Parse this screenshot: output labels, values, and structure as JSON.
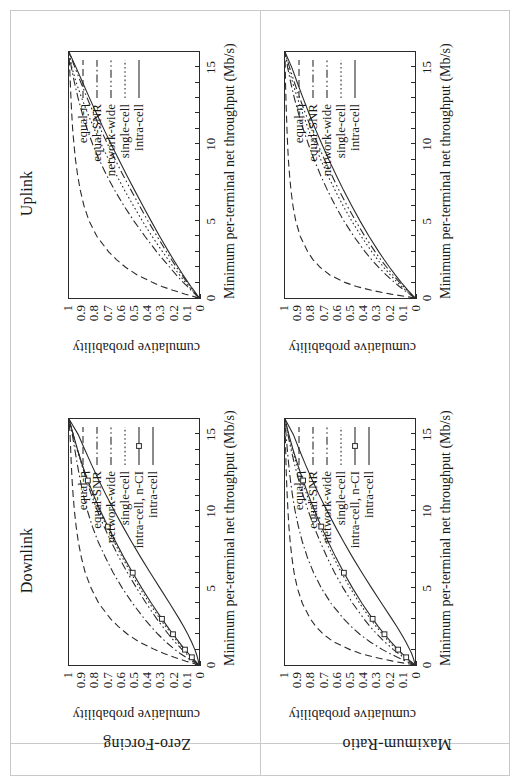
{
  "figure": {
    "orientation": "rotated-90-ccw",
    "columns": [
      "Downlink",
      "Uplink"
    ],
    "rows": [
      "Zero-Forcing",
      "Maximum-Ratio"
    ],
    "axis": {
      "xlabel": "Minimum per-terminal net throughput (Mb/s)",
      "ylabel": "cumulative probability",
      "xticks": [
        "0",
        "5",
        "10",
        "15"
      ],
      "yticks": [
        "0",
        "0.1",
        "0.2",
        "0.3",
        "0.4",
        "0.5",
        "0.6",
        "0.7",
        "0.8",
        "0.9",
        "1"
      ]
    }
  },
  "legend": {
    "downlink": [
      {
        "label": "equal-η",
        "style": "dashed"
      },
      {
        "label": "equal-SNR",
        "style": "dashdot"
      },
      {
        "label": "network-wide",
        "style": "dashdotdot"
      },
      {
        "label": "single-cell",
        "style": "dotted"
      },
      {
        "label": "intra-cell, n-CI",
        "style": "solid-square"
      },
      {
        "label": "intra-cell",
        "style": "solid"
      }
    ],
    "uplink": [
      {
        "label": "equal-η",
        "style": "dashed"
      },
      {
        "label": "equal-SNR",
        "style": "dashdot"
      },
      {
        "label": "network-wide",
        "style": "dashdotdot"
      },
      {
        "label": "single-cell",
        "style": "dotted"
      },
      {
        "label": "intra-cell",
        "style": "solid"
      }
    ]
  },
  "colors": {
    "ink": "#2b2b2b",
    "frame": "#c9c9c9",
    "background": "#ffffff"
  },
  "chart_data": [
    {
      "id": "downlink-zero-forcing",
      "type": "line",
      "title": "Downlink / Zero-Forcing",
      "xlabel": "Minimum per-terminal net throughput (Mb/s)",
      "ylabel": "cumulative probability",
      "xlim": [
        0,
        16
      ],
      "ylim": [
        0,
        1
      ],
      "grid": false,
      "legend_position": "upper-right",
      "x": [
        0,
        0.25,
        0.5,
        0.75,
        1,
        1.5,
        2,
        2.5,
        3,
        4,
        5,
        6,
        7,
        8,
        9,
        10,
        11,
        12,
        13,
        14,
        15,
        16
      ],
      "series": [
        {
          "name": "equal-η",
          "style": "dashed",
          "values": [
            0,
            0.1,
            0.19,
            0.27,
            0.34,
            0.46,
            0.55,
            0.62,
            0.68,
            0.77,
            0.83,
            0.875,
            0.905,
            0.928,
            0.945,
            0.958,
            0.968,
            0.976,
            0.982,
            0.987,
            0.992,
            1.0
          ]
        },
        {
          "name": "equal-SNR",
          "style": "dashdot",
          "values": [
            0,
            0.05,
            0.1,
            0.145,
            0.185,
            0.255,
            0.315,
            0.37,
            0.42,
            0.51,
            0.59,
            0.66,
            0.72,
            0.775,
            0.82,
            0.857,
            0.888,
            0.913,
            0.935,
            0.955,
            0.975,
            1.0
          ]
        },
        {
          "name": "network-wide",
          "style": "dashdotdot",
          "values": [
            0,
            0.035,
            0.07,
            0.1,
            0.13,
            0.185,
            0.235,
            0.28,
            0.325,
            0.405,
            0.48,
            0.55,
            0.615,
            0.675,
            0.73,
            0.78,
            0.825,
            0.865,
            0.9,
            0.935,
            0.968,
            1.0
          ]
        },
        {
          "name": "single-cell",
          "style": "dotted",
          "values": [
            0,
            0.03,
            0.06,
            0.088,
            0.115,
            0.165,
            0.21,
            0.255,
            0.3,
            0.38,
            0.455,
            0.525,
            0.59,
            0.652,
            0.71,
            0.765,
            0.815,
            0.86,
            0.9,
            0.938,
            0.97,
            1.0
          ]
        },
        {
          "name": "intra-cell, n-CI",
          "style": "solid-square",
          "values": [
            0,
            0.028,
            0.055,
            0.082,
            0.108,
            0.155,
            0.2,
            0.243,
            0.285,
            0.365,
            0.44,
            0.51,
            0.578,
            0.64,
            0.7,
            0.757,
            0.808,
            0.855,
            0.897,
            0.934,
            0.968,
            1.0
          ]
        },
        {
          "name": "intra-cell",
          "style": "solid",
          "values": [
            0,
            0.005,
            0.012,
            0.021,
            0.032,
            0.057,
            0.086,
            0.118,
            0.152,
            0.225,
            0.3,
            0.375,
            0.448,
            0.518,
            0.585,
            0.65,
            0.712,
            0.77,
            0.825,
            0.878,
            0.93,
            1.0
          ]
        }
      ]
    },
    {
      "id": "uplink-zero-forcing",
      "type": "line",
      "title": "Uplink / Zero-Forcing",
      "xlabel": "Minimum per-terminal net throughput (Mb/s)",
      "ylabel": "cumulative probability",
      "xlim": [
        0,
        16
      ],
      "ylim": [
        0,
        1
      ],
      "grid": false,
      "legend_position": "upper-right",
      "x": [
        0,
        0.25,
        0.5,
        0.75,
        1,
        1.5,
        2,
        2.5,
        3,
        4,
        5,
        6,
        7,
        8,
        9,
        10,
        11,
        12,
        13,
        14,
        15,
        16
      ],
      "series": [
        {
          "name": "equal-η",
          "style": "dashed",
          "values": [
            0,
            0.105,
            0.2,
            0.285,
            0.355,
            0.475,
            0.565,
            0.635,
            0.695,
            0.785,
            0.845,
            0.885,
            0.913,
            0.934,
            0.95,
            0.962,
            0.972,
            0.979,
            0.985,
            0.99,
            0.995,
            1.0
          ]
        },
        {
          "name": "equal-SNR",
          "style": "dashdot",
          "values": [
            0,
            0.03,
            0.06,
            0.09,
            0.12,
            0.175,
            0.225,
            0.275,
            0.325,
            0.415,
            0.5,
            0.578,
            0.648,
            0.712,
            0.768,
            0.818,
            0.861,
            0.898,
            0.93,
            0.958,
            0.982,
            1.0
          ]
        },
        {
          "name": "network-wide",
          "style": "dashdotdot",
          "values": [
            0,
            0.022,
            0.045,
            0.068,
            0.09,
            0.132,
            0.173,
            0.212,
            0.25,
            0.322,
            0.392,
            0.458,
            0.522,
            0.585,
            0.645,
            0.703,
            0.758,
            0.81,
            0.86,
            0.908,
            0.955,
            1.0
          ]
        },
        {
          "name": "single-cell",
          "style": "dotted",
          "values": [
            0,
            0.026,
            0.052,
            0.078,
            0.103,
            0.15,
            0.195,
            0.238,
            0.28,
            0.36,
            0.435,
            0.505,
            0.572,
            0.635,
            0.695,
            0.752,
            0.806,
            0.856,
            0.902,
            0.944,
            0.978,
            1.0
          ]
        },
        {
          "name": "intra-cell",
          "style": "solid",
          "values": [
            0,
            0.02,
            0.04,
            0.062,
            0.083,
            0.122,
            0.16,
            0.197,
            0.233,
            0.302,
            0.368,
            0.432,
            0.495,
            0.557,
            0.617,
            0.676,
            0.733,
            0.788,
            0.842,
            0.894,
            0.946,
            1.0
          ]
        }
      ]
    },
    {
      "id": "downlink-maximum-ratio",
      "type": "line",
      "title": "Downlink / Maximum-Ratio",
      "xlabel": "Minimum per-terminal net throughput (Mb/s)",
      "ylabel": "cumulative probability",
      "xlim": [
        0,
        16
      ],
      "ylim": [
        0,
        1
      ],
      "grid": false,
      "legend_position": "upper-right",
      "x": [
        0,
        0.25,
        0.5,
        0.75,
        1,
        1.5,
        2,
        2.5,
        3,
        4,
        5,
        6,
        7,
        8,
        9,
        10,
        11,
        12,
        13,
        14,
        15,
        16
      ],
      "series": [
        {
          "name": "equal-η",
          "style": "dashed",
          "values": [
            0,
            0.17,
            0.31,
            0.42,
            0.5,
            0.625,
            0.705,
            0.762,
            0.805,
            0.866,
            0.905,
            0.93,
            0.947,
            0.96,
            0.97,
            0.977,
            0.983,
            0.988,
            0.992,
            0.995,
            0.998,
            1.0
          ]
        },
        {
          "name": "equal-SNR",
          "style": "dashdot",
          "values": [
            0,
            0.07,
            0.135,
            0.195,
            0.25,
            0.345,
            0.425,
            0.49,
            0.548,
            0.645,
            0.72,
            0.78,
            0.828,
            0.866,
            0.897,
            0.922,
            0.942,
            0.958,
            0.971,
            0.982,
            0.992,
            1.0
          ]
        },
        {
          "name": "network-wide",
          "style": "dashdotdot",
          "values": [
            0,
            0.045,
            0.088,
            0.128,
            0.166,
            0.233,
            0.292,
            0.345,
            0.393,
            0.478,
            0.552,
            0.618,
            0.676,
            0.729,
            0.777,
            0.82,
            0.859,
            0.894,
            0.925,
            0.953,
            0.978,
            1.0
          ]
        },
        {
          "name": "single-cell",
          "style": "dotted",
          "values": [
            0,
            0.038,
            0.074,
            0.108,
            0.14,
            0.198,
            0.25,
            0.298,
            0.343,
            0.425,
            0.498,
            0.565,
            0.626,
            0.683,
            0.735,
            0.784,
            0.829,
            0.87,
            0.908,
            0.943,
            0.974,
            1.0
          ]
        },
        {
          "name": "intra-cell, n-CI",
          "style": "solid-square",
          "values": [
            0,
            0.035,
            0.068,
            0.1,
            0.13,
            0.185,
            0.235,
            0.282,
            0.326,
            0.407,
            0.48,
            0.547,
            0.609,
            0.667,
            0.721,
            0.771,
            0.818,
            0.861,
            0.901,
            0.938,
            0.971,
            1.0
          ]
        },
        {
          "name": "intra-cell",
          "style": "solid",
          "values": [
            0,
            0.006,
            0.015,
            0.026,
            0.04,
            0.07,
            0.104,
            0.14,
            0.178,
            0.256,
            0.333,
            0.408,
            0.48,
            0.548,
            0.613,
            0.675,
            0.734,
            0.789,
            0.841,
            0.89,
            0.936,
            1.0
          ]
        }
      ]
    },
    {
      "id": "uplink-maximum-ratio",
      "type": "line",
      "title": "Uplink / Maximum-Ratio",
      "xlabel": "Minimum per-terminal net throughput (Mb/s)",
      "ylabel": "cumulative probability",
      "xlim": [
        0,
        16
      ],
      "ylim": [
        0,
        1
      ],
      "grid": false,
      "legend_position": "upper-right",
      "x": [
        0,
        0.25,
        0.5,
        0.75,
        1,
        1.5,
        2,
        2.5,
        3,
        4,
        5,
        6,
        7,
        8,
        9,
        10,
        11,
        12,
        13,
        14,
        15,
        16
      ],
      "series": [
        {
          "name": "equal-η",
          "style": "dashed",
          "values": [
            0,
            0.185,
            0.335,
            0.45,
            0.535,
            0.655,
            0.73,
            0.785,
            0.825,
            0.882,
            0.917,
            0.939,
            0.954,
            0.965,
            0.974,
            0.98,
            0.985,
            0.989,
            0.993,
            0.996,
            0.998,
            1.0
          ]
        },
        {
          "name": "equal-SNR",
          "style": "dashdot",
          "values": [
            0,
            0.042,
            0.082,
            0.12,
            0.156,
            0.222,
            0.28,
            0.334,
            0.383,
            0.47,
            0.546,
            0.613,
            0.673,
            0.727,
            0.776,
            0.82,
            0.86,
            0.896,
            0.928,
            0.956,
            0.98,
            1.0
          ]
        },
        {
          "name": "network-wide",
          "style": "dashdotdot",
          "values": [
            0,
            0.03,
            0.06,
            0.089,
            0.117,
            0.17,
            0.218,
            0.264,
            0.306,
            0.385,
            0.456,
            0.522,
            0.584,
            0.641,
            0.696,
            0.748,
            0.797,
            0.843,
            0.886,
            0.927,
            0.965,
            1.0
          ]
        },
        {
          "name": "single-cell",
          "style": "dotted",
          "values": [
            0,
            0.036,
            0.07,
            0.103,
            0.134,
            0.19,
            0.241,
            0.288,
            0.332,
            0.413,
            0.486,
            0.553,
            0.615,
            0.672,
            0.725,
            0.775,
            0.821,
            0.864,
            0.904,
            0.941,
            0.973,
            1.0
          ]
        },
        {
          "name": "intra-cell",
          "style": "solid",
          "values": [
            0,
            0.027,
            0.054,
            0.08,
            0.105,
            0.152,
            0.196,
            0.238,
            0.278,
            0.353,
            0.422,
            0.487,
            0.549,
            0.607,
            0.663,
            0.716,
            0.767,
            0.815,
            0.861,
            0.905,
            0.948,
            1.0
          ]
        }
      ]
    }
  ]
}
